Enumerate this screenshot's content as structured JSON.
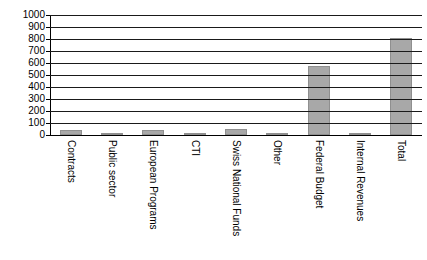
{
  "chart_data": {
    "type": "bar",
    "title": "",
    "xlabel": "",
    "ylabel": "",
    "ylim": [
      0,
      1000
    ],
    "ytick_step": 100,
    "grid": true,
    "legend": false,
    "bar_color": "#a8a8a8",
    "bar_edge_color": "#8f8f8f",
    "axis_color": "#000000",
    "background": "#ffffff",
    "ytick_labels": [
      "1000",
      "900",
      "800",
      "700",
      "600",
      "500",
      "400",
      "300",
      "200",
      "100",
      "0"
    ],
    "ytick_values": [
      1000,
      900,
      800,
      700,
      600,
      500,
      400,
      300,
      200,
      100,
      0
    ],
    "categories": [
      "Contracts",
      "Public sector",
      "European Programs",
      "CTI",
      "Swiss National Funds",
      "Other",
      "Federal Budget",
      "Internal Revenues",
      "Total"
    ],
    "values": [
      45,
      8,
      45,
      12,
      48,
      15,
      575,
      20,
      810
    ]
  }
}
